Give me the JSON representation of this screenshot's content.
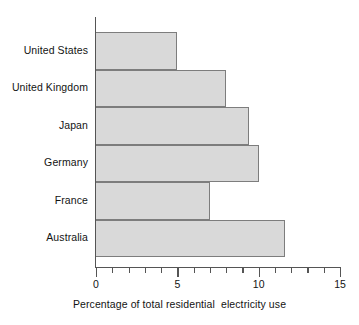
{
  "chart_data": {
    "type": "bar",
    "orientation": "horizontal",
    "title": "",
    "xlabel": "Percentage of total residential  electricity use",
    "ylabel": "",
    "categories": [
      "United States",
      "United Kingdom",
      "Japan",
      "Germany",
      "France",
      "Australia"
    ],
    "values": [
      5.0,
      8.0,
      9.4,
      10.0,
      7.0,
      11.6
    ],
    "xlim": [
      0,
      15
    ],
    "xticks": [
      0,
      5,
      10,
      15
    ],
    "xtick_labels": [
      "0",
      "5",
      "10",
      "15"
    ],
    "minor_xticks": [
      1,
      2,
      3,
      4,
      6,
      7,
      8,
      9,
      11,
      12,
      13,
      14
    ],
    "grid": false,
    "legend": null,
    "bar_fill_color": "#d9d9d9",
    "bar_border_color": "#7d7d7d",
    "axis_color": "#555555",
    "text_color": "#131313",
    "background_color": "#ffffff"
  }
}
